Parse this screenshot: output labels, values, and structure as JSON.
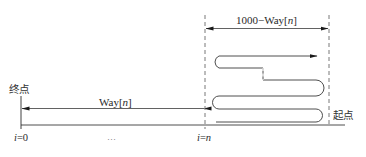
{
  "diagram": {
    "type": "path-schematic",
    "colors": {
      "line": "#2a2a2a",
      "dashed": "#555555",
      "background": "#ffffff"
    },
    "labels": {
      "end_point": "终点",
      "start_point": "起点",
      "way_prefix": "Way[",
      "way_var": "n",
      "way_suffix": "]",
      "remaining_prefix": "1000−Way[",
      "remaining_var": "n",
      "remaining_suffix": "]",
      "i_zero_var": "i",
      "i_zero_rest": "=0",
      "ellipsis": "…",
      "i_n_var": "i",
      "i_n_eq": "=",
      "i_n_val": "n"
    },
    "markers": [
      {
        "position": "i=0",
        "x": 21
      },
      {
        "position": "i=n",
        "x": 205
      }
    ],
    "segments": [
      {
        "name": "Way[n]",
        "from_x": 205,
        "to_x": 21,
        "direction": "left"
      },
      {
        "name": "1000-Way[n]",
        "from_x": 205,
        "to_x": 329,
        "direction": "both"
      }
    ]
  }
}
